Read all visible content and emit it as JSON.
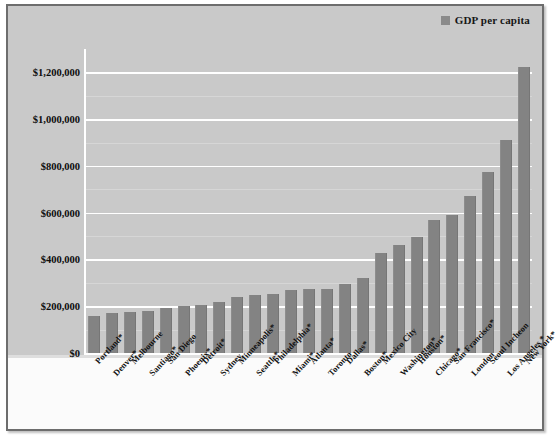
{
  "legend": {
    "label": "GDP per capita",
    "swatch_color": "#8a8a8a",
    "icon": "legend-square-icon"
  },
  "axis": {
    "y_ticks": [
      "$0",
      "$200,000",
      "$400,000",
      "$600,000",
      "$800,000",
      "$1,000,000",
      "$1,200,000"
    ]
  },
  "colors": {
    "bar": "#838383",
    "plot_background": "#c9c9c9",
    "label_background": "#fbfbfb",
    "gridline": "#ffffff",
    "frame_border": "#6d6d6d",
    "text": "#101010"
  },
  "chart_data": {
    "type": "bar",
    "title": "",
    "xlabel": "",
    "ylabel": "",
    "ylim": [
      0,
      1300000
    ],
    "ytick_step": 200000,
    "grid": true,
    "legend_position": "top-right",
    "series_name": "GDP per capita",
    "categories": [
      "Portland*",
      "Denver*",
      "Melbourne",
      "Santiago*",
      "San Diego",
      "Phoenix*",
      "Detroit*",
      "Sydney",
      "Minneapolis*",
      "Seattle*",
      "Philadelphia*",
      "Miami*",
      "Atlanta*",
      "Toronto",
      "Dallas*",
      "Boston*",
      "Mexico City",
      "Washington*",
      "Houston*",
      "Chicago*",
      "San Francisco*",
      "London",
      "Seoul Incheon",
      "Los Angeles *",
      "New York*"
    ],
    "values": [
      157000,
      172000,
      174000,
      178000,
      192000,
      200000,
      205000,
      220000,
      241000,
      248000,
      252000,
      268000,
      272000,
      275000,
      297000,
      320000,
      428000,
      463000,
      497000,
      570000,
      590000,
      672000,
      772000,
      912000,
      1222000
    ]
  }
}
